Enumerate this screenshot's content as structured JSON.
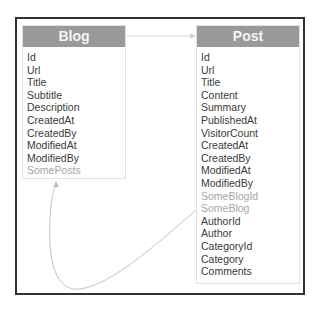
{
  "entities": [
    {
      "name": "Blog",
      "properties": [
        {
          "label": "Id",
          "navigation": false
        },
        {
          "label": "Url",
          "navigation": false
        },
        {
          "label": "Title",
          "navigation": false
        },
        {
          "label": "Subtitle",
          "navigation": false
        },
        {
          "label": "Description",
          "navigation": false
        },
        {
          "label": "CreatedAt",
          "navigation": false
        },
        {
          "label": "CreatedBy",
          "navigation": false
        },
        {
          "label": "ModifiedAt",
          "navigation": false
        },
        {
          "label": "ModifiedBy",
          "navigation": false
        },
        {
          "label": "SomePosts",
          "navigation": true
        }
      ]
    },
    {
      "name": "Post",
      "properties": [
        {
          "label": "Id",
          "navigation": false
        },
        {
          "label": "Url",
          "navigation": false
        },
        {
          "label": "Title",
          "navigation": false
        },
        {
          "label": "Content",
          "navigation": false
        },
        {
          "label": "Summary",
          "navigation": false
        },
        {
          "label": "PublishedAt",
          "navigation": false
        },
        {
          "label": "VisitorCount",
          "navigation": false
        },
        {
          "label": "CreatedAt",
          "navigation": false
        },
        {
          "label": "CreatedBy",
          "navigation": false
        },
        {
          "label": "ModifiedAt",
          "navigation": false
        },
        {
          "label": "ModifiedBy",
          "navigation": false
        },
        {
          "label": "SomeBlogId",
          "navigation": true
        },
        {
          "label": "SomeBlog",
          "navigation": true
        },
        {
          "label": "AuthorId",
          "navigation": false
        },
        {
          "label": "Author",
          "navigation": false
        },
        {
          "label": "CategoryId",
          "navigation": false
        },
        {
          "label": "Category",
          "navigation": false
        },
        {
          "label": "Comments",
          "navigation": false
        }
      ]
    }
  ],
  "relationships": [
    {
      "from": "Blog",
      "to": "Post",
      "style": "header-arrow"
    },
    {
      "from": "Post.SomeBlog",
      "to": "Blog.SomePosts",
      "style": "curved-arrow"
    }
  ],
  "colors": {
    "header_bg": "#9a9a9a",
    "header_text": "#f4f4f4",
    "property_text": "#3a3a3a",
    "navigation_text": "#a5a5a5",
    "frame_border": "#333333",
    "connector": "#c8c8c8"
  }
}
